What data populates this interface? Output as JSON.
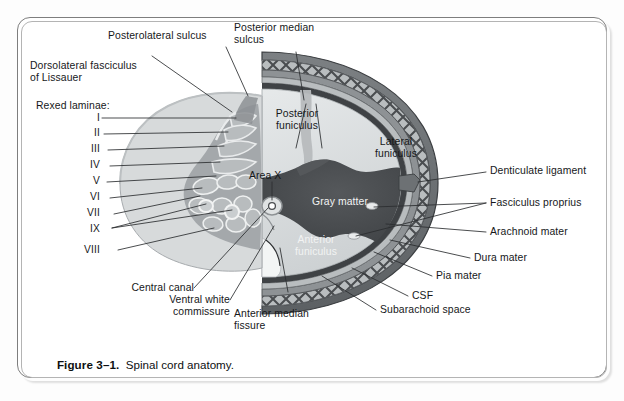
{
  "figure": {
    "number": "Figure 3–1.",
    "title": "Spinal cord anatomy.",
    "frame_color": "#7e7e7e",
    "background": "#ffffff"
  },
  "colors": {
    "gray_matter": "#4a4d50",
    "white_matter_light": "#dde0e1",
    "white_matter_mid": "#c3c7c9",
    "laminae_fan": "#d7dadb",
    "laminae_core": "#9fa4a7",
    "dura": "#6d7174",
    "arachnoid": "#8e9295",
    "pia": "#3f4245",
    "csf": "#b9bdbf",
    "trabeculae": "#4a4d50",
    "leader_line": "#2b2d2f",
    "text": "#16181a"
  },
  "labels": {
    "posterolateral_sulcus": "Posterolateral sulcus",
    "posterior_median_sulcus": "Posterior median\nsulcus",
    "dorsolateral_fasciculus": "Dorsolateral fasciculus\nof Lissauer",
    "rexed_laminae_heading": "Rexed laminae:",
    "posterior_funiculus": "Posterior\nfuniculus",
    "area_x": "Area X",
    "lateral_funiculus": "Lateral\nfuniculus",
    "gray_matter": "Gray matter",
    "anterior_funiculus": "Anterior\nfuniculus",
    "denticulate_ligament": "Denticulate ligament",
    "fasciculus_proprius": "Fasciculus proprius",
    "arachnoid_mater": "Arachnoid mater",
    "dura_mater": "Dura mater",
    "pia_mater": "Pia mater",
    "csf": "CSF",
    "subarachnoid_space": "Subarachoid space",
    "central_canal": "Central canal",
    "ventral_white_commissure": "Ventral white\ncommissure",
    "anterior_median_fissure": "Anterior median\nfissure"
  },
  "rexed_laminae": [
    {
      "numeral": "I",
      "y": 118
    },
    {
      "numeral": "II",
      "y": 133
    },
    {
      "numeral": "III",
      "y": 149
    },
    {
      "numeral": "IV",
      "y": 165
    },
    {
      "numeral": "V",
      "y": 181
    },
    {
      "numeral": "VI",
      "y": 197
    },
    {
      "numeral": "VII",
      "y": 213
    },
    {
      "numeral": "IX",
      "y": 229
    },
    {
      "numeral": "VIII",
      "y": 250
    }
  ]
}
